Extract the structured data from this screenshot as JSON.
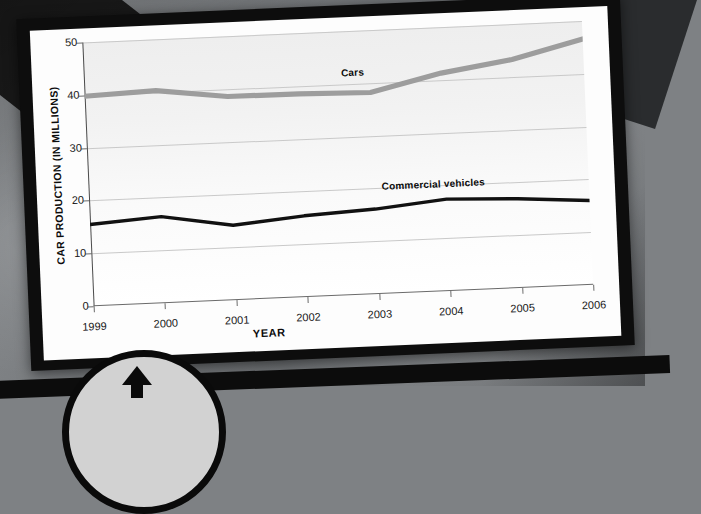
{
  "page": {
    "media_type": "photographed-textbook-page",
    "frame_color": "#0d0d0d",
    "paper_color": "#fdfdfd",
    "background_color": "#7e8184"
  },
  "controls": {
    "scroll_up_button": {
      "name": "scroll-up-button",
      "icon": "arrow-up-icon",
      "fill_color": "#d2d2d2",
      "border_color": "#0a0a0a"
    }
  },
  "chart_data": {
    "type": "line",
    "title": "",
    "xlabel": "YEAR",
    "ylabel": "CAR PRODUCTION (IN MILLIONS)",
    "categories": [
      "1999",
      "2000",
      "2001",
      "2002",
      "2003",
      "2004",
      "2005",
      "2006"
    ],
    "x": [
      1999,
      2000,
      2001,
      2002,
      2003,
      2004,
      2005,
      2006
    ],
    "ylim": [
      0,
      50
    ],
    "yticks": [
      0,
      10,
      20,
      30,
      40,
      50
    ],
    "grid": true,
    "legend_position": "inline-labels",
    "series": [
      {
        "name": "Cars",
        "color": "#9d9d9d",
        "values": [
          39.8,
          40.3,
          38.6,
          38.5,
          38.2,
          41.3,
          43.3,
          46.6
        ],
        "label_x": 2002.6,
        "label_y": 43.2
      },
      {
        "name": "Commercial vehicles",
        "color": "#111111",
        "values": [
          15.5,
          16.4,
          14.2,
          15.4,
          16.1,
          17.4,
          16.9,
          16.0
        ],
        "label_x": 2003.1,
        "label_y": 21.4
      }
    ]
  }
}
